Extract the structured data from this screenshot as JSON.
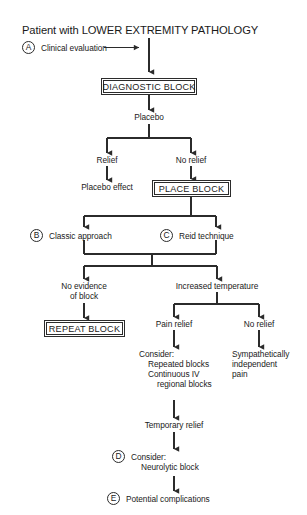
{
  "diagram": {
    "title": "Patient with LOWER EXTREMITY PATHOLOGY",
    "type": "clinical-decision-flowchart",
    "colors": {
      "line": "#2b2b2b",
      "text": "#1a1a1a",
      "background": "#ffffff"
    },
    "step_markers": [
      {
        "letter": "A",
        "label": "Clinical evaluation"
      },
      {
        "letter": "B",
        "label": "Classic approach"
      },
      {
        "letter": "C",
        "label": "Reid technique"
      },
      {
        "letter": "D",
        "label": "Consider:"
      },
      {
        "letter": "E",
        "label": "Potential complications"
      }
    ],
    "nodes": {
      "clinical_evaluation": "Clinical evaluation",
      "diagnostic_block": "DIAGNOSTIC BLOCK",
      "placebo": "Placebo",
      "relief": "Relief",
      "no_relief_1": "No relief",
      "placebo_effect": "Placebo effect",
      "place_block": "PLACE BLOCK",
      "classic_approach": "Classic approach",
      "reid_technique": "Reid technique",
      "no_evidence_of_block": "No evidence\nof block",
      "increased_temperature": "Increased temperature",
      "repeat_block": "REPEAT BLOCK",
      "pain_relief": "Pain relief",
      "no_relief_2": "No relief",
      "consider_list_line1": "Consider:",
      "consider_list_line2": "Repeated blocks",
      "consider_list_line3": "Continuous IV",
      "consider_list_line4": "regional blocks",
      "sympathetically_independent_pain": "Sympathetically\nindependent\npain",
      "temporary_relief": "Temporary relief",
      "consider_neurolytic_line1": "Consider:",
      "consider_neurolytic_line2": "Neurolytic block",
      "potential_complications": "Potential complications"
    }
  }
}
